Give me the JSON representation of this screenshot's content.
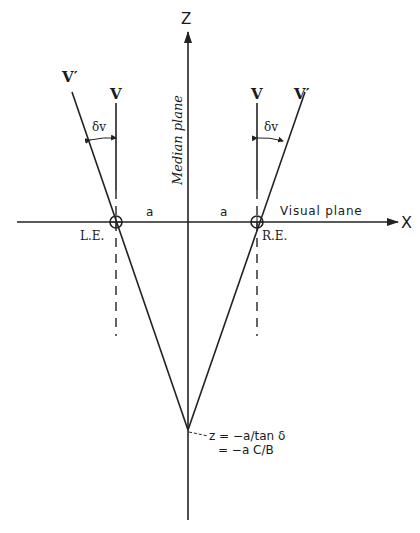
{
  "axes": {
    "z_label": "Z",
    "x_label": "X",
    "median_plane_label": "Median plane",
    "visual_plane_label": "Visual plane"
  },
  "eyes": {
    "left_label": "L.E.",
    "right_label": "R.E."
  },
  "lines": {
    "left_v_label": "V",
    "left_vprime_label": "V′",
    "right_v_label": "V",
    "right_vprime_label": "V′",
    "left_angle_label": "δv",
    "right_angle_label": "δv"
  },
  "distances": {
    "left_a": "a",
    "right_a": "a"
  },
  "vertex_annotation": {
    "line1": "z = −a/tan  δ",
    "line2": "= −a C/B"
  }
}
